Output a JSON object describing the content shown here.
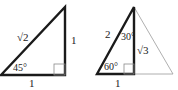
{
  "diagram": {
    "colors": {
      "stroke": "#1a1a1a",
      "thin": "#9a9a9a",
      "text": "#222222"
    },
    "triangle_45": {
      "hypotenuse_label": "√2",
      "vertical_label": "1",
      "base_label": "1",
      "angle_label": "45°"
    },
    "triangle_30_60": {
      "hypotenuse_label": "2",
      "vertical_label": "√3",
      "base_label": "1",
      "top_angle_label": "30°",
      "bottom_angle_label": "60°"
    }
  }
}
